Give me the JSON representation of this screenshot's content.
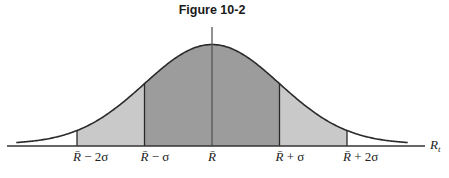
{
  "chart_data": {
    "type": "area",
    "title": "Figure 10-2",
    "xlabel": "R",
    "xlabel_subscript": "t",
    "ylabel": "",
    "distribution": "normal",
    "mean": 0,
    "sd": 1,
    "xlim": [
      -3.1,
      3.0
    ],
    "curve_extent": [
      -2.9,
      2.9
    ],
    "grid": false,
    "legend": "none",
    "center_line": true,
    "shaded_regions": [
      {
        "name": "within-2-sigma-left",
        "from": -2,
        "to": -1,
        "color": "#c9c9c9"
      },
      {
        "name": "within-1-sigma",
        "from": -1,
        "to": 1,
        "color": "#9c9c9c"
      },
      {
        "name": "within-2-sigma-right",
        "from": 1,
        "to": 2,
        "color": "#c9c9c9"
      }
    ],
    "ticks": [
      {
        "value": -2,
        "base": "R̄",
        "suffix": " − 2σ"
      },
      {
        "value": -1,
        "base": "R̄",
        "suffix": " − σ"
      },
      {
        "value": 0,
        "base": "R̄",
        "suffix": ""
      },
      {
        "value": 1,
        "base": "R̄",
        "suffix": " + σ"
      },
      {
        "value": 2,
        "base": "R̄",
        "suffix": " + 2σ"
      }
    ],
    "colors": {
      "line": "#2a2a2a",
      "axis": "#333333"
    }
  }
}
